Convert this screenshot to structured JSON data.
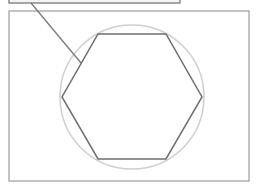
{
  "diagram": {
    "type": "geometry",
    "callout_box": {
      "x": 9,
      "y": -10,
      "width": 171,
      "height": 13
    },
    "frame": {
      "x": 9,
      "y": 11,
      "width": 240,
      "height": 170
    },
    "circle": {
      "cx": 132,
      "cy": 97,
      "r": 72
    },
    "hexagon": {
      "points": "98,34 166,34 202,97 166,159 98,159 62,97"
    },
    "leader_line": {
      "x1": 31,
      "y1": 3,
      "x2": 81,
      "y2": 63
    },
    "colors": {
      "frame": "#8a8a8a",
      "callout": "#8a8a8a",
      "circle": "#cfcfcf",
      "hexagon": "#6e6e6e",
      "leader": "#7a7a7a"
    }
  }
}
